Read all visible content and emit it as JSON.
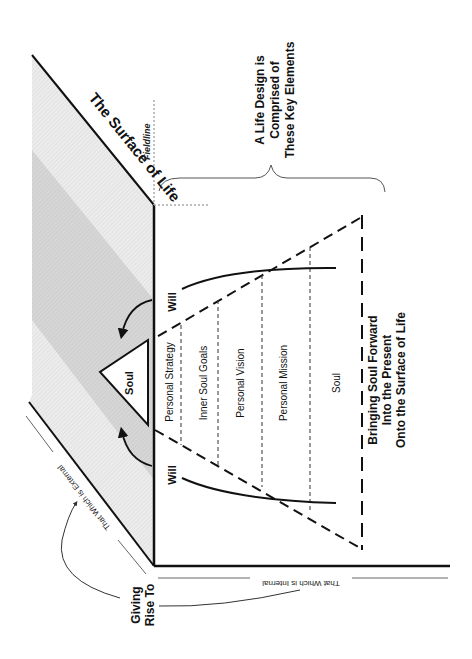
{
  "diagram": {
    "title_surface": "The Surface of Life",
    "fieldline_label": "Fieldline",
    "brace_label": {
      "line1": "A Life Design is",
      "line2": "Comprised of",
      "line3": "These Key Elements"
    },
    "soul_apex_label": "Soul",
    "will_left": "Will",
    "will_right": "Will",
    "layers": [
      {
        "label": "Personal Strategy"
      },
      {
        "label": "Inner Soul Goals"
      },
      {
        "label": "Personal Vision"
      },
      {
        "label": "Personal Mission"
      },
      {
        "label": "Soul"
      }
    ],
    "caption": {
      "line1": "Bringing Soul Forward",
      "line2": "Into the Present",
      "line3": "Onto the Surface of Life"
    },
    "external_label": "That Which is External",
    "internal_label": "That Which is Internal",
    "giving_rise": {
      "line1": "Giving",
      "line2": "Rise To"
    },
    "colors": {
      "line": "#111111",
      "band_light": "#e6e6e6",
      "band_dark": "#d2d2d2",
      "thin_line": "#555555",
      "dotted": "#aaaaaa"
    }
  }
}
